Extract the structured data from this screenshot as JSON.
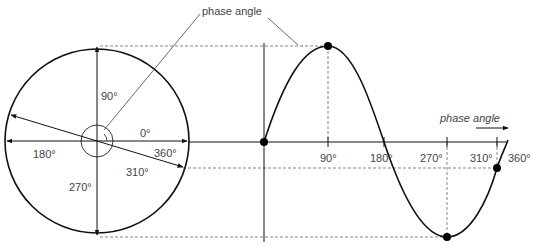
{
  "title_label": "phase angle",
  "circle": {
    "labels": {
      "deg90": "90°",
      "deg0": "0°",
      "deg180": "180°",
      "deg360": "360°",
      "deg270": "270°",
      "deg310": "310°"
    }
  },
  "wave": {
    "axis_label": "phase angle",
    "ticks": [
      {
        "label": "90°"
      },
      {
        "label": "180°"
      },
      {
        "label": "270°"
      },
      {
        "label": "310°"
      },
      {
        "label": "360°"
      }
    ]
  },
  "colors": {
    "stroke": "#111111",
    "dashed": "#555555",
    "text": "#444444"
  }
}
